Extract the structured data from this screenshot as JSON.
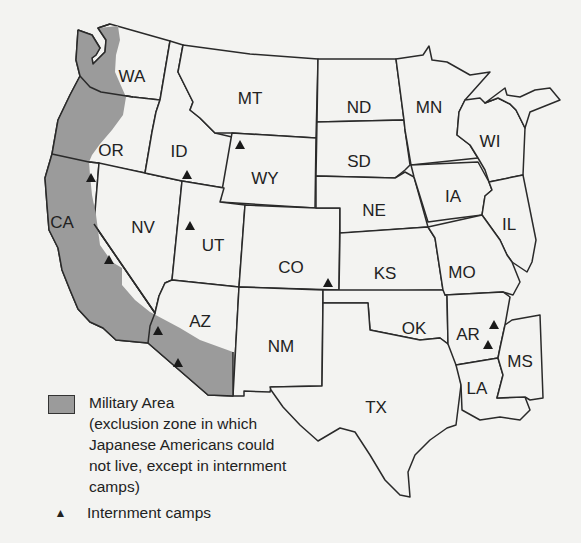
{
  "map": {
    "region": "Western and Central United States",
    "states": [
      {
        "abbr": "WA",
        "x": 132,
        "y": 76
      },
      {
        "abbr": "OR",
        "x": 111,
        "y": 150
      },
      {
        "abbr": "ID",
        "x": 179,
        "y": 151
      },
      {
        "abbr": "MT",
        "x": 250,
        "y": 98
      },
      {
        "abbr": "ND",
        "x": 359,
        "y": 107
      },
      {
        "abbr": "MN",
        "x": 429,
        "y": 107
      },
      {
        "abbr": "WI",
        "x": 490,
        "y": 141
      },
      {
        "abbr": "SD",
        "x": 359,
        "y": 161
      },
      {
        "abbr": "WY",
        "x": 265,
        "y": 178
      },
      {
        "abbr": "IA",
        "x": 453,
        "y": 196
      },
      {
        "abbr": "IL",
        "x": 509,
        "y": 224
      },
      {
        "abbr": "NE",
        "x": 374,
        "y": 210
      },
      {
        "abbr": "CA",
        "x": 62,
        "y": 222
      },
      {
        "abbr": "NV",
        "x": 143,
        "y": 227
      },
      {
        "abbr": "UT",
        "x": 213,
        "y": 245
      },
      {
        "abbr": "CO",
        "x": 291,
        "y": 267
      },
      {
        "abbr": "KS",
        "x": 385,
        "y": 273
      },
      {
        "abbr": "MO",
        "x": 462,
        "y": 272
      },
      {
        "abbr": "AZ",
        "x": 200,
        "y": 321
      },
      {
        "abbr": "NM",
        "x": 281,
        "y": 346
      },
      {
        "abbr": "OK",
        "x": 414,
        "y": 328
      },
      {
        "abbr": "AR",
        "x": 468,
        "y": 334
      },
      {
        "abbr": "MS",
        "x": 520,
        "y": 361
      },
      {
        "abbr": "LA",
        "x": 477,
        "y": 388
      },
      {
        "abbr": "TX",
        "x": 376,
        "y": 407
      }
    ],
    "camps": [
      {
        "state": "WY",
        "x": 240,
        "y": 145
      },
      {
        "state": "ID",
        "x": 187,
        "y": 175
      },
      {
        "state": "CA",
        "x": 91,
        "y": 178
      },
      {
        "state": "UT",
        "x": 190,
        "y": 226
      },
      {
        "state": "CA",
        "x": 109,
        "y": 260
      },
      {
        "state": "CO",
        "x": 328,
        "y": 283
      },
      {
        "state": "AZ",
        "x": 158,
        "y": 331
      },
      {
        "state": "AZ",
        "x": 178,
        "y": 363
      },
      {
        "state": "AR",
        "x": 494,
        "y": 325
      },
      {
        "state": "AR",
        "x": 488,
        "y": 345
      }
    ],
    "colors": {
      "military_area": "#9b9b9b",
      "state_fill": "#f3f3f1",
      "border": "#2a2a2a",
      "camp": "#1a1a1a"
    }
  },
  "legend": {
    "military_area_label": "Military Area",
    "military_area_desc": "(exclusion zone in which Japanese Americans could not live, except in internment camps)",
    "camps_label": "Internment camps",
    "camp_symbol": "▲"
  }
}
